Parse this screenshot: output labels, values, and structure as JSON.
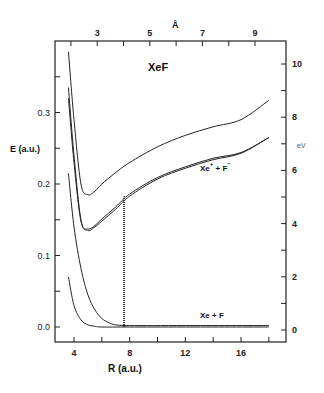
{
  "chart_data": {
    "type": "line",
    "title": "XeF",
    "xlabel": "R (a.u.)",
    "ylabel": "E (a.u.)",
    "x2label": "Å",
    "y2label": "eV",
    "xlim": [
      2.6,
      19.2
    ],
    "ylim": [
      -0.02,
      0.395
    ],
    "grid": false,
    "legend": "none",
    "x_ticks": [
      4,
      6,
      8,
      10,
      12,
      14,
      16,
      18
    ],
    "x_tick_labels": [
      "4",
      "",
      "8",
      "",
      "12",
      "",
      "16",
      ""
    ],
    "y_ticks": [
      0.0,
      0.05,
      0.1,
      0.15,
      0.2,
      0.25,
      0.3,
      0.35
    ],
    "y_tick_labels": [
      "0.0",
      "",
      "0.1",
      "",
      "0.2",
      "",
      "0.3",
      ""
    ],
    "x2_ticks_angstrom": [
      2,
      3,
      4,
      5,
      6,
      7,
      8,
      9
    ],
    "x2_tick_labels": [
      "",
      "3",
      "",
      "5",
      "",
      "7",
      "",
      "9"
    ],
    "y2_ticks_ev": [
      0,
      1,
      2,
      3,
      4,
      5,
      6,
      7,
      8,
      9,
      10
    ],
    "y2_tick_labels": [
      "0",
      "",
      "2",
      "",
      "4",
      "",
      "6",
      "",
      "8",
      "",
      "10"
    ],
    "annotations": [
      {
        "text": "XeF",
        "x": 11.0,
        "y": 0.33
      },
      {
        "text": "Xe⁺ + F⁻",
        "x": 15.0,
        "y": 0.215
      },
      {
        "text": "Xe + F",
        "x": 15.0,
        "y": 0.035
      }
    ],
    "series": [
      {
        "name": "Ionic upper state",
        "x": [
          3.6,
          4.0,
          4.5,
          5.0,
          5.5,
          6.0,
          7.0,
          8.0,
          10.0,
          12.0,
          14.0,
          16.0,
          18.0
        ],
        "y": [
          0.385,
          0.29,
          0.2,
          0.185,
          0.19,
          0.2,
          0.216,
          0.23,
          0.252,
          0.268,
          0.28,
          0.29,
          0.317
        ]
      },
      {
        "name": "Xe+ + F- (a)",
        "x": [
          3.6,
          4.0,
          4.5,
          5.0,
          5.5,
          6.0,
          7.0,
          8.0,
          10.0,
          12.0,
          14.0,
          16.0,
          18.0
        ],
        "y": [
          0.335,
          0.24,
          0.15,
          0.135,
          0.14,
          0.148,
          0.165,
          0.183,
          0.207,
          0.222,
          0.234,
          0.243,
          0.265
        ]
      },
      {
        "name": "Xe+ + F- (b)",
        "x": [
          3.6,
          4.0,
          4.5,
          5.0,
          5.5,
          6.0,
          7.0,
          8.0,
          10.0,
          12.0,
          14.0,
          16.0,
          18.0
        ],
        "y": [
          0.32,
          0.23,
          0.148,
          0.137,
          0.142,
          0.151,
          0.168,
          0.186,
          0.209,
          0.224,
          0.236,
          0.244,
          0.265
        ]
      },
      {
        "name": "Covalent repulsive",
        "x": [
          3.6,
          4.0,
          4.5,
          5.0,
          5.5,
          6.0,
          6.5,
          7.0,
          8.0,
          12.0,
          18.0
        ],
        "y": [
          0.215,
          0.14,
          0.082,
          0.045,
          0.024,
          0.012,
          0.006,
          0.003,
          0.002,
          0.002,
          0.002
        ]
      },
      {
        "name": "Xe + F ground",
        "x": [
          3.6,
          4.0,
          4.5,
          5.0,
          5.5,
          6.0,
          8.0,
          12.0,
          18.0
        ],
        "y": [
          0.07,
          0.03,
          0.01,
          0.003,
          0.001,
          0.0,
          0.0,
          0.0,
          0.0
        ]
      },
      {
        "name": "Vertical transition (hatched)",
        "x": [
          7.6,
          7.6
        ],
        "y": [
          0.0,
          0.183
        ]
      }
    ]
  },
  "labels": {
    "title": "XeF",
    "ionic": "Xe",
    "ionic_plus": "+",
    "ionic_mid": " + F",
    "ionic_minus": "−",
    "neutral": "Xe + F",
    "xlabel": "R (a.u.)",
    "ylabel": "E (a.u.)",
    "x2label": "Å",
    "y2label": "eV"
  }
}
